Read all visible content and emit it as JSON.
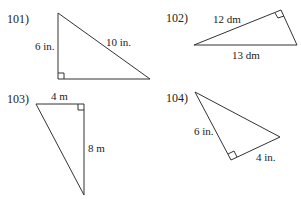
{
  "problems": [
    {
      "number": "101)",
      "labels": {
        "leg_vertical": "6 in.",
        "hypotenuse": "10 in."
      }
    },
    {
      "number": "102)",
      "labels": {
        "leg": "12 dm",
        "hypotenuse": "13 dm"
      }
    },
    {
      "number": "103)",
      "labels": {
        "leg_top": "4 m",
        "leg_vertical": "8 m"
      }
    },
    {
      "number": "104)",
      "labels": {
        "leg_left": "6 in.",
        "leg_right": "4 in."
      }
    }
  ],
  "colors": {
    "line": "#333333",
    "text": "#222222",
    "background": "#ffffff"
  }
}
